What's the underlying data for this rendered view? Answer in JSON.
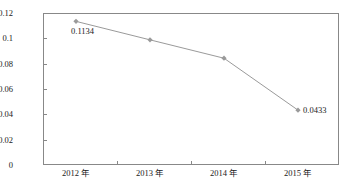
{
  "chart_data": {
    "type": "line",
    "title": "",
    "xlabel": "",
    "ylabel": "",
    "categories": [
      "2012 年",
      "2013 年",
      "2014 年",
      "2015 年"
    ],
    "values": [
      0.1134,
      0.0988,
      0.0843,
      0.0433
    ],
    "point_labels": [
      "0.1134",
      "",
      "",
      "0.0433"
    ],
    "ylim": [
      0,
      0.12
    ],
    "ytick_labels": [
      "0.12",
      "0.1",
      "0.08",
      "0.06",
      "0.04",
      "0.02",
      "0"
    ],
    "ytick_values": [
      0.12,
      0.1,
      0.08,
      0.06,
      0.04,
      0.02,
      0
    ],
    "grid": false,
    "legend": null,
    "series": [
      {
        "name": "",
        "values": [
          0.1134,
          0.0988,
          0.0843,
          0.0433
        ],
        "line_color": "#9a9a9a",
        "marker": "diamond",
        "marker_color": "#9a9a9a"
      }
    ],
    "colors": {
      "line": "#9a9a9a",
      "marker": "#9a9a9a",
      "axis": "#888888",
      "text": "#1a1a1a",
      "background": "#ffffff"
    }
  }
}
